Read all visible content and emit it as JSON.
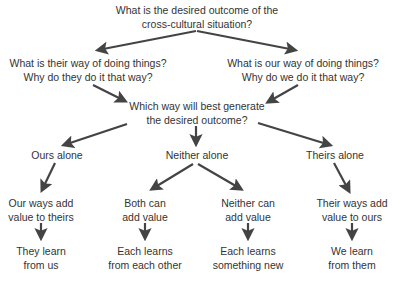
{
  "diagram": {
    "colors": {
      "text": "#333333",
      "arrow": "#444444",
      "background": "#ffffff"
    },
    "nodes": {
      "root": {
        "line1": "What is the desired outcome of the",
        "line2": "cross-cultural situation?"
      },
      "their_way": {
        "line1": "What is their way of doing things?",
        "line2": "Why do they do it that way?"
      },
      "our_way": {
        "line1": "What is our way of doing things?",
        "line2": "Why do we do it that way?"
      },
      "which_way": {
        "line1": "Which way will best generate",
        "line2": "the desired outcome?"
      },
      "ours_alone": {
        "line1": "Ours alone"
      },
      "neither_alone": {
        "line1": "Neither alone"
      },
      "theirs_alone": {
        "line1": "Theirs alone"
      },
      "our_ways_add": {
        "line1": "Our ways add",
        "line2": "value to theirs"
      },
      "both_can_add": {
        "line1": "Both can",
        "line2": "add value"
      },
      "neither_can_add": {
        "line1": "Neither can",
        "line2": "add value"
      },
      "their_ways_add": {
        "line1": "Their ways add",
        "line2": "value to ours"
      },
      "they_learn": {
        "line1": "They learn",
        "line2": "from us"
      },
      "each_learns_other": {
        "line1": "Each learns",
        "line2": "from each other"
      },
      "each_learns_new": {
        "line1": "Each learns",
        "line2": "something new"
      },
      "we_learn": {
        "line1": "We learn",
        "line2": "from them"
      }
    },
    "edges": [
      [
        "root",
        "their_way"
      ],
      [
        "root",
        "our_way"
      ],
      [
        "their_way",
        "which_way"
      ],
      [
        "our_way",
        "which_way"
      ],
      [
        "which_way",
        "ours_alone"
      ],
      [
        "which_way",
        "neither_alone"
      ],
      [
        "which_way",
        "theirs_alone"
      ],
      [
        "ours_alone",
        "our_ways_add"
      ],
      [
        "neither_alone",
        "both_can_add"
      ],
      [
        "neither_alone",
        "neither_can_add"
      ],
      [
        "theirs_alone",
        "their_ways_add"
      ],
      [
        "our_ways_add",
        "they_learn"
      ],
      [
        "both_can_add",
        "each_learns_other"
      ],
      [
        "neither_can_add",
        "each_learns_new"
      ],
      [
        "their_ways_add",
        "we_learn"
      ]
    ]
  }
}
